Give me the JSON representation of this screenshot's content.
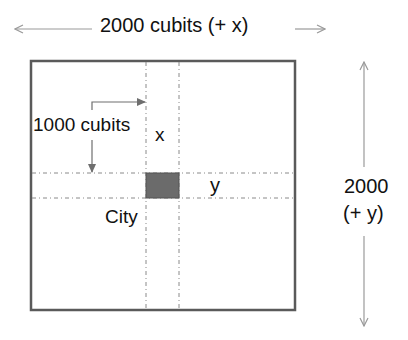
{
  "diagram": {
    "top_dimension": {
      "label": "2000 cubits (+ x)"
    },
    "right_dimension": {
      "line1": "2000",
      "line2": "(+ y)"
    },
    "offset_label": "1000 cubits",
    "x_label": "x",
    "y_label": "y",
    "city_label": "City",
    "colors": {
      "border": "#5a5a5a",
      "city_fill": "#6b6b6b",
      "arrow": "#9a9a9a",
      "connector": "#6e6e6e",
      "dash": "#8a8a8a"
    }
  }
}
